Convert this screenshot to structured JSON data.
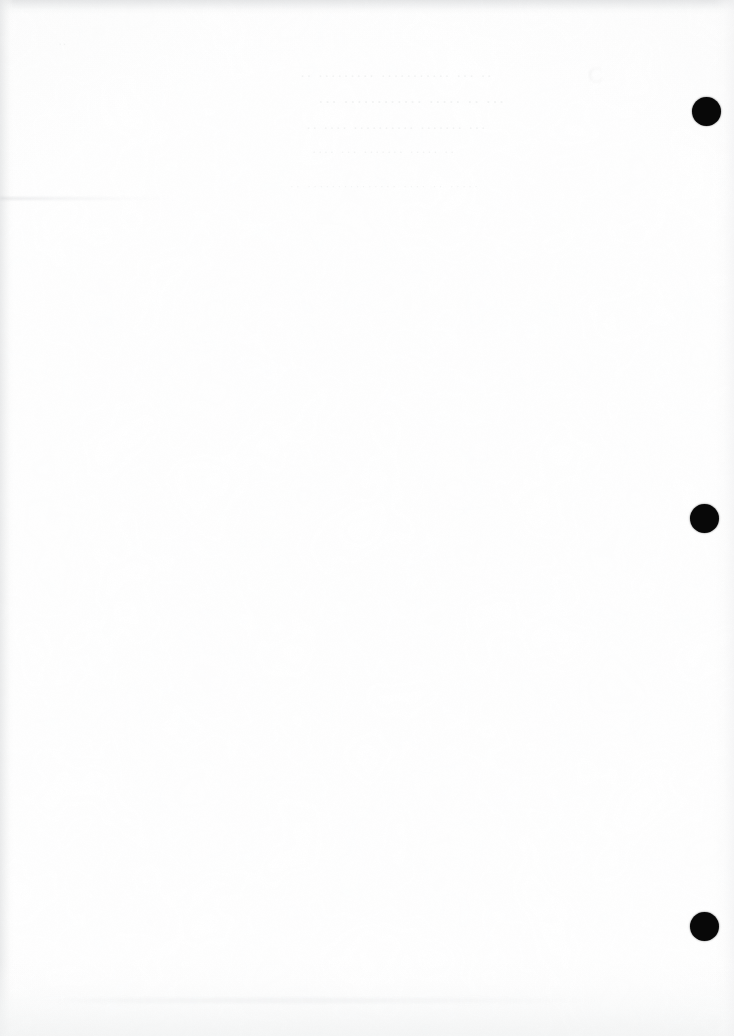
{
  "page": {
    "kind": "scanned-document-page",
    "width": 734,
    "height": 1036,
    "paper_color": "#ffffff",
    "edge_band_color": "#e8e9ea",
    "content_state": "blank"
  },
  "registration_dots": {
    "label": "black registration dots",
    "color": "#080808",
    "items": [
      {
        "name": "registration-dot-top",
        "cx": 706,
        "cy": 111,
        "d": 29
      },
      {
        "name": "registration-dot-middle",
        "cx": 704,
        "cy": 518,
        "d": 29
      },
      {
        "name": "registration-dot-bottom",
        "cx": 704,
        "cy": 926,
        "d": 29
      }
    ]
  },
  "ghost_text": {
    "note": "bleed-through residue from reverse side; illegible at scan resolution",
    "color": "#787c82",
    "lines": [
      {
        "id": "ghost-line-1",
        "text": "··  ········· ···········  ···  ··"
      },
      {
        "id": "ghost-line-2",
        "text": "··· ············ ····· ··  ···"
      },
      {
        "id": "ghost-line-3",
        "text": "·· ···· ·········· ······· ···"
      },
      {
        "id": "ghost-line-4",
        "text": "····  ··· ·······  ····· ··"
      },
      {
        "id": "ghost-line-5",
        "text": "·· ··············· ···· ··  ·····"
      }
    ],
    "mark_top_left": "··",
    "mark_upper_right": "C"
  },
  "artifacts": {
    "smudge_streak_left": "horizontal toner streak",
    "smudge_band_bottom": "horizontal texture band"
  }
}
